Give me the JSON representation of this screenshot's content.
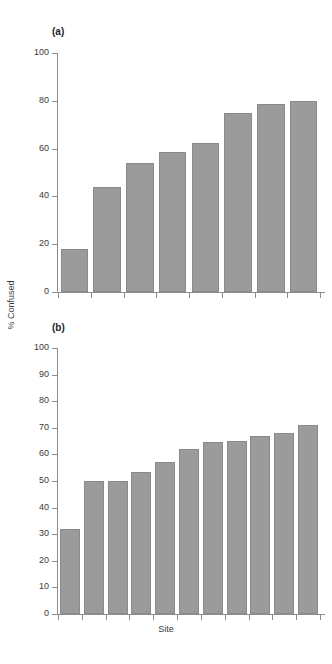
{
  "figure": {
    "ylabel": "% Confused",
    "xlabel": "Site",
    "bar_color": "#9b9b9b",
    "bar_edge_color": "#8a8a8a",
    "axis_color": "#8d8d8d",
    "background": "#ffffff"
  },
  "panels": [
    {
      "label": "(a)"
    },
    {
      "label": "(b)"
    }
  ],
  "chart_data": [
    {
      "type": "bar",
      "title": "(a)",
      "panel": "a",
      "xlabel": "Site",
      "ylabel": "% Confused",
      "ylim": [
        0,
        100
      ],
      "yticks": [
        0,
        20,
        40,
        60,
        80,
        100
      ],
      "ytick_labels": [
        "0",
        "20",
        "40",
        "60",
        "80",
        "100"
      ],
      "grid": false,
      "legend": false,
      "categories": [
        "1",
        "2",
        "3",
        "4",
        "5",
        "6",
        "7",
        "8"
      ],
      "values": [
        18,
        44,
        54,
        58.5,
        62.5,
        75,
        78.5,
        80
      ]
    },
    {
      "type": "bar",
      "title": "(b)",
      "panel": "b",
      "xlabel": "Site",
      "ylabel": "% Confused",
      "ylim": [
        0,
        100
      ],
      "yticks": [
        0,
        10,
        20,
        30,
        40,
        50,
        60,
        70,
        80,
        90,
        100
      ],
      "ytick_labels": [
        "0",
        "10",
        "20",
        "30",
        "40",
        "50",
        "60",
        "70",
        "80",
        "90",
        "100"
      ],
      "grid": false,
      "legend": false,
      "categories": [
        "1",
        "2",
        "3",
        "4",
        "5",
        "6",
        "7",
        "8",
        "9",
        "10",
        "11"
      ],
      "values": [
        32,
        50,
        50,
        53.5,
        57,
        62,
        64.5,
        65,
        67,
        68,
        71
      ]
    }
  ]
}
